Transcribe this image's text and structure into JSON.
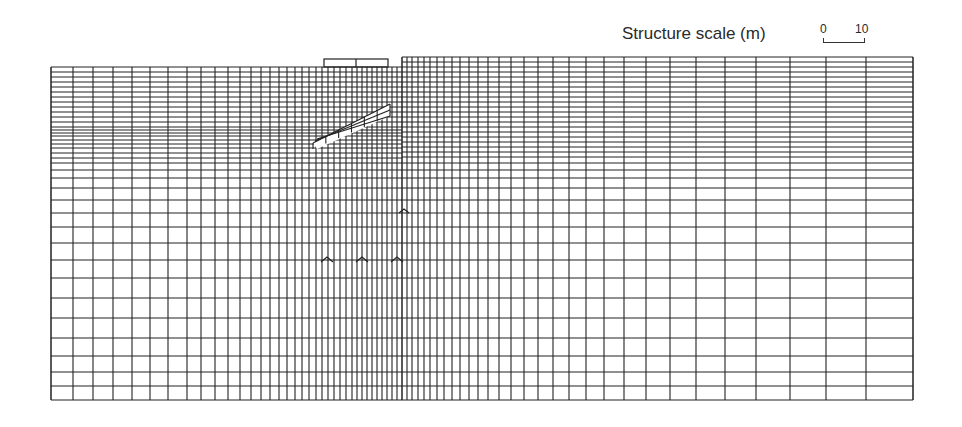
{
  "figure": {
    "type": "finite element mesh",
    "scale_label": "Structure scale (m)",
    "scale_bar": {
      "start": "0",
      "end": "10"
    }
  },
  "mesh": {
    "color": "#222222",
    "left_top": 67,
    "right_top": 57,
    "bottom": 400,
    "left_edge": 51,
    "right_edge": 913,
    "wall_x": 402,
    "columns_x": [
      51,
      73,
      93,
      113,
      132,
      150,
      168,
      187,
      201,
      215,
      228,
      240,
      251,
      261,
      270,
      279,
      287,
      295,
      302,
      309,
      316,
      322,
      328,
      334,
      340,
      346,
      352,
      357,
      362,
      367,
      372,
      377,
      382,
      387,
      392,
      397,
      402,
      407,
      412,
      418,
      424,
      430,
      437,
      444,
      452,
      460,
      469,
      478,
      488,
      499,
      511,
      524,
      538,
      553,
      569,
      586,
      604,
      624,
      646,
      670,
      696,
      725,
      756,
      790,
      826,
      866,
      913
    ],
    "rows_left_y": [
      67,
      72,
      77,
      82,
      87,
      92,
      97,
      102,
      107,
      112,
      117,
      122,
      127,
      130,
      133,
      136,
      140,
      144,
      148,
      153,
      158,
      163,
      170,
      178,
      188,
      200,
      213,
      227,
      243,
      260,
      278,
      298,
      318,
      338,
      356,
      372,
      386,
      400
    ],
    "rows_right_y": [
      57,
      62,
      67,
      72,
      77,
      82,
      87,
      92,
      97,
      102,
      107,
      112,
      117,
      122,
      127,
      132,
      137,
      142,
      147,
      152,
      157,
      163,
      170,
      178,
      188,
      200,
      213,
      227,
      243,
      260,
      278,
      298,
      318,
      338,
      356,
      372,
      386,
      400
    ],
    "structure_box": {
      "x": 324,
      "y": 59,
      "w": 64,
      "h": 8,
      "divider_x": 356
    },
    "slope_band": {
      "from": [
        313,
        143
      ],
      "to": [
        390,
        104
      ],
      "offsets": [
        0,
        6,
        12
      ],
      "cross_count": 6
    },
    "bumps": [
      {
        "x": 327,
        "y": 262,
        "w": 6,
        "h": 5
      },
      {
        "x": 362,
        "y": 262,
        "w": 6,
        "h": 5
      },
      {
        "x": 397,
        "y": 262,
        "w": 6,
        "h": 5
      },
      {
        "x": 404,
        "y": 213,
        "w": 5,
        "h": 4
      }
    ]
  }
}
